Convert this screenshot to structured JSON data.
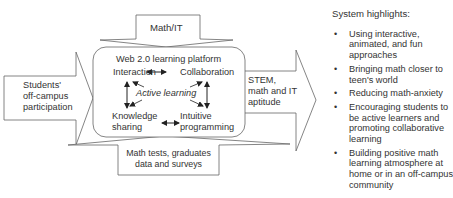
{
  "diagram": {
    "left_input": {
      "label": "Students' off-campus participation",
      "lines": [
        "Students'",
        "off-campus",
        "participation"
      ]
    },
    "top_input": {
      "label": "Math/IT"
    },
    "center_box": {
      "title": "Web 2.0 learning platform",
      "nodes": {
        "top_left": "Interaction",
        "top_right": "Collaboration",
        "center": "Active learning",
        "bottom_left": [
          "Knowledge",
          "sharing"
        ],
        "bottom_right": [
          "Intuitive",
          "programming"
        ]
      }
    },
    "right_output": {
      "lines": [
        "STEM,",
        "math and IT",
        "aptitude"
      ]
    },
    "bottom_input": {
      "lines": [
        "Math tests, graduates",
        "data and surveys"
      ]
    }
  },
  "highlights": {
    "title": "System highlights:",
    "items": [
      "Using interactive, animated, and fun approaches",
      "Bringing math closer to teen's world",
      "Reducing math-anxiety",
      "Encouraging students to be active learners and promoting collaborative learning",
      "Building positive math learning atmosphere at home or in an off-campus community"
    ]
  },
  "colors": {
    "stroke": "#555555",
    "text": "#333333",
    "arrow": "#222222"
  }
}
